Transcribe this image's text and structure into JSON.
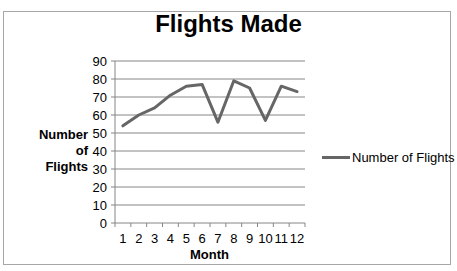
{
  "chart_data": {
    "type": "line",
    "title": "Flights Made",
    "xlabel": "Month",
    "ylabel": "Number of Flights",
    "categories": [
      "1",
      "2",
      "3",
      "4",
      "5",
      "6",
      "7",
      "8",
      "9",
      "10",
      "11",
      "12"
    ],
    "series": [
      {
        "name": "Number of Flights",
        "color": "#666666",
        "values": [
          54,
          60,
          64,
          71,
          76,
          77,
          56,
          79,
          75,
          57,
          76,
          73
        ]
      }
    ],
    "ylim": [
      0,
      90
    ],
    "yticks": [
      0,
      10,
      20,
      30,
      40,
      50,
      60,
      70,
      80,
      90
    ],
    "grid": true,
    "legend_position": "right"
  },
  "labels": {
    "title": "Flights Made",
    "ylabel_line1": "Number of",
    "ylabel_line2": "Flights",
    "xlabel": "Month",
    "legend": "Number of Flights"
  }
}
